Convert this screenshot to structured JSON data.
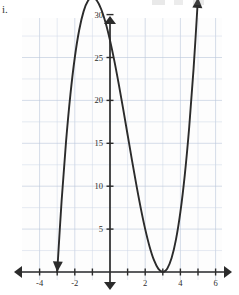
{
  "item_label": "i.",
  "colors": {
    "curve": "#2b2b2b",
    "axis": "#2b2b2b",
    "grid_minor": "#ccd6e6",
    "grid_major": "#b9c6da",
    "background": "#ffffff"
  },
  "chart_data": {
    "type": "line",
    "title": "",
    "subtitle": "",
    "xlabel": "",
    "ylabel": "",
    "xlim": [
      -4.9,
      6.8
    ],
    "ylim": [
      -3.2,
      36.5
    ],
    "grid": true,
    "legend": null,
    "x_ticks": [
      -4,
      -2,
      2,
      4,
      6
    ],
    "x_tick_labels": [
      "-4",
      "-2",
      "2",
      "4",
      "6"
    ],
    "x_tick_minor_step": 1,
    "y_ticks": [
      5,
      10,
      15,
      20,
      25,
      30
    ],
    "y_tick_labels": [
      "5",
      "10",
      "15",
      "20",
      "25",
      "30"
    ],
    "y_tick_minor_step": 5,
    "axis_arrows": [
      "left",
      "right",
      "up",
      "down"
    ],
    "function_description": "cubic y = (x + 3)(x - 3)^2",
    "roots": [
      -3,
      3
    ],
    "double_root": 3,
    "y_intercept": 27,
    "local_maximum": {
      "x": -1,
      "y": 32
    },
    "local_minimum": {
      "x": 3,
      "y": 0
    },
    "series": [
      {
        "name": "y = (x + 3)(x - 3)^2",
        "x": [
          -3.25,
          -3.0,
          -2.75,
          -2.5,
          -2.25,
          -2.0,
          -1.75,
          -1.5,
          -1.25,
          -1.0,
          -0.75,
          -0.5,
          -0.25,
          0.0,
          0.25,
          0.5,
          0.75,
          1.0,
          1.25,
          1.5,
          1.75,
          2.0,
          2.25,
          2.5,
          2.75,
          3.0,
          3.25,
          3.5,
          3.75,
          4.0,
          4.25,
          4.5,
          4.75,
          5.0,
          5.1
        ],
        "y": [
          -9.77,
          0.0,
          8.27,
          15.13,
          20.672,
          25.0,
          28.203,
          30.375,
          31.609,
          32.0,
          31.641,
          30.625,
          29.047,
          27.0,
          24.578,
          21.875,
          18.984,
          16.0,
          13.016,
          10.125,
          7.422,
          5.0,
          2.953,
          1.375,
          0.359,
          0.0,
          0.391,
          1.625,
          3.797,
          7.0,
          11.328,
          16.875,
          23.734,
          32.0,
          35.721
        ]
      }
    ]
  }
}
